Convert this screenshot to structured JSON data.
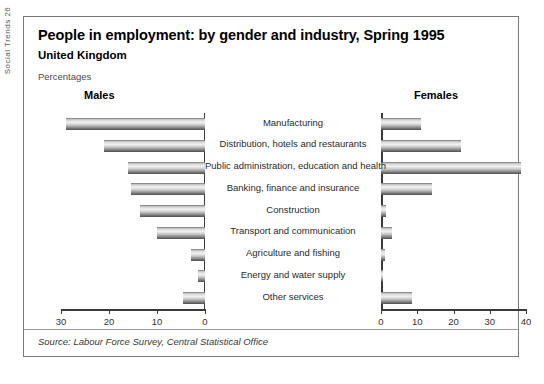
{
  "gutter": {
    "text": "Social Trends 26"
  },
  "figure": {
    "title": "People in employment: by gender and industry, Spring 1995",
    "subtitle": "United Kingdom",
    "units": "Percentages",
    "source": "Source: Labour Force Survey, Central Statistical Office",
    "panel_males": "Males",
    "panel_females": "Females"
  },
  "chart_data": {
    "type": "bar",
    "orientation": "horizontal-diverging",
    "title": "People in employment: by gender and industry, Spring 1995",
    "subtitle": "United Kingdom",
    "ylabel": "",
    "xlabel": "Percentages",
    "grid": false,
    "legend_position": "panel-headings",
    "categories": [
      "Manufacturing",
      "Distribution, hotels and restaurants",
      "Public administration, education and health",
      "Banking, finance and insurance",
      "Construction",
      "Transport and communication",
      "Agriculture and fishing",
      "Energy and water supply",
      "Other services"
    ],
    "series": [
      {
        "name": "Males",
        "side": "left",
        "axis_ticks": [
          30,
          20,
          10,
          0
        ],
        "xlim": [
          30,
          0
        ],
        "values": [
          29.0,
          21.0,
          16.0,
          15.5,
          13.5,
          10.0,
          3.0,
          1.5,
          4.5
        ]
      },
      {
        "name": "Females",
        "side": "right",
        "axis_ticks": [
          0,
          10,
          20,
          30,
          40
        ],
        "xlim": [
          0,
          40
        ],
        "values": [
          11.0,
          22.0,
          38.5,
          14.0,
          1.5,
          3.0,
          1.0,
          0.5,
          8.5
        ]
      }
    ]
  }
}
